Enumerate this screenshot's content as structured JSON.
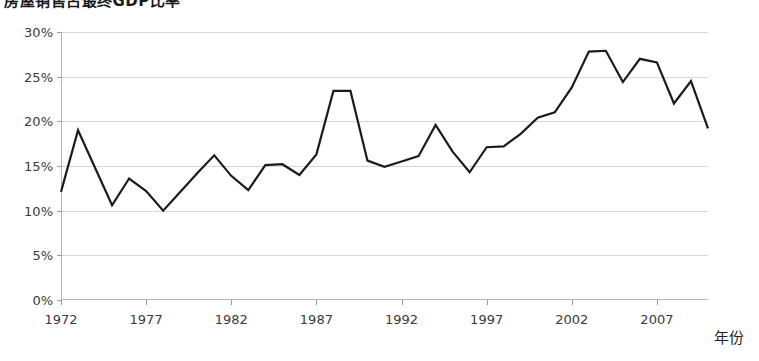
{
  "chart_data": {
    "type": "line",
    "title": "房屋销售占最终GDP比率",
    "xlabel": "年份",
    "ylabel": "",
    "xlim": [
      1972,
      2010
    ],
    "ylim": [
      0,
      30
    ],
    "grid": true,
    "legend": null,
    "y_ticks": [
      "0%",
      "5%",
      "10%",
      "15%",
      "20%",
      "25%",
      "30%"
    ],
    "y_tick_values": [
      0,
      5,
      10,
      15,
      20,
      25,
      30
    ],
    "x_ticks": [
      "1972",
      "1977",
      "1982",
      "1987",
      "1992",
      "1997",
      "2002",
      "2007"
    ],
    "x_tick_values": [
      1972,
      1977,
      1982,
      1987,
      1992,
      1997,
      2002,
      2007
    ],
    "x": [
      1972,
      1973,
      1974,
      1975,
      1976,
      1977,
      1978,
      1979,
      1980,
      1981,
      1982,
      1983,
      1984,
      1985,
      1986,
      1987,
      1988,
      1989,
      1990,
      1991,
      1992,
      1993,
      1994,
      1995,
      1996,
      1997,
      1998,
      1999,
      2000,
      2001,
      2002,
      2003,
      2004,
      2005,
      2006,
      2007,
      2008,
      2009,
      2010
    ],
    "values": [
      12.1,
      19.0,
      14.8,
      10.6,
      13.6,
      12.2,
      10.0,
      12.1,
      14.2,
      16.2,
      13.9,
      12.3,
      15.1,
      15.2,
      14.0,
      16.3,
      23.4,
      23.4,
      15.6,
      14.9,
      15.5,
      16.1,
      19.6,
      16.6,
      14.3,
      17.1,
      17.2,
      18.6,
      20.4,
      21.0,
      23.8,
      27.8,
      27.9,
      24.4,
      27.0,
      26.6,
      22.0,
      24.5,
      19.2
    ],
    "series": [
      {
        "name": "房屋销售占GDP比率",
        "color": "#1b1b1b",
        "values": [
          12.1,
          19.0,
          14.8,
          10.6,
          13.6,
          12.2,
          10.0,
          12.1,
          14.2,
          16.2,
          13.9,
          12.3,
          15.1,
          15.2,
          14.0,
          16.3,
          23.4,
          23.4,
          15.6,
          14.9,
          15.5,
          16.1,
          19.6,
          16.6,
          14.3,
          17.1,
          17.2,
          18.6,
          20.4,
          21.0,
          23.8,
          27.8,
          27.9,
          24.4,
          27.0,
          26.6,
          22.0,
          24.5,
          19.2
        ]
      }
    ]
  }
}
